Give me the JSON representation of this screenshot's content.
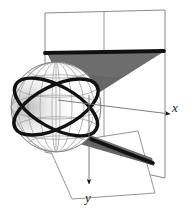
{
  "figure": {
    "background_color": "#ffffff",
    "width": 191,
    "height": 217
  },
  "axes": {
    "x_label": "x",
    "y_label": "y",
    "axis_line_color": "#6e6e6e",
    "arrow_color": "#1a1a1a"
  },
  "sphere": {
    "name": "wireframe-sphere",
    "wireframe_color": "#9a9a9a",
    "outline_color": "#707070",
    "center_x": 56,
    "center_y": 107,
    "radius_x": 45,
    "radius_y": 45
  },
  "great_circles": {
    "name": "great-circle-pair",
    "color": "#111111",
    "stroke_width": 3.4,
    "count": 2
  },
  "cone": {
    "name": "tangent-cone",
    "fill_color": "#666666",
    "edge_color": "#111111",
    "upper_wedge": true,
    "lower_wedge": true
  },
  "planes": {
    "vertical_plane": {
      "name": "vertical-plane",
      "fill_color": "#ffffff",
      "edge_color": "#8a8a8a",
      "divider": true
    },
    "horizontal_plane": {
      "name": "horizontal-plane",
      "fill_color": "#ffffff",
      "edge_color": "#8a8a8a"
    }
  },
  "colors": {
    "line_gray": "#8a8a8a",
    "wire_gray": "#9a9a9a",
    "cone_gray": "#666666",
    "black": "#111111"
  }
}
